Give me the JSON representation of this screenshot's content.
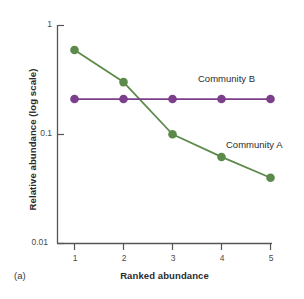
{
  "panel": {
    "label": "(a)"
  },
  "chart_data": {
    "type": "line",
    "title": "",
    "subtitle": "",
    "xlabel": "Ranked abundance",
    "ylabel": "Relative abundance (log scale)",
    "x": [
      1,
      2,
      3,
      4,
      5
    ],
    "xticklabels": [
      "1",
      "2",
      "3",
      "4",
      "5"
    ],
    "yticks": [
      1,
      0.1,
      0.01
    ],
    "yticklabels": [
      "1",
      "0.1",
      "0.01"
    ],
    "ylim": [
      0.01,
      1
    ],
    "xlim": [
      0.6,
      5.4
    ],
    "yscale": "log",
    "grid": false,
    "legend": "inline-labels",
    "series": [
      {
        "name": "Community A",
        "color": "#5c8a4a",
        "marker": "circle",
        "values": [
          0.59,
          0.3,
          0.1,
          0.062,
          0.04
        ]
      },
      {
        "name": "Community B",
        "color": "#7b3f8c",
        "marker": "circle",
        "values": [
          0.21,
          0.21,
          0.21,
          0.21,
          0.21
        ]
      }
    ],
    "annotations": [
      {
        "text": "Community B",
        "series": "Community B"
      },
      {
        "text": "Community A",
        "series": "Community A"
      }
    ],
    "axis_color": "#555555"
  }
}
